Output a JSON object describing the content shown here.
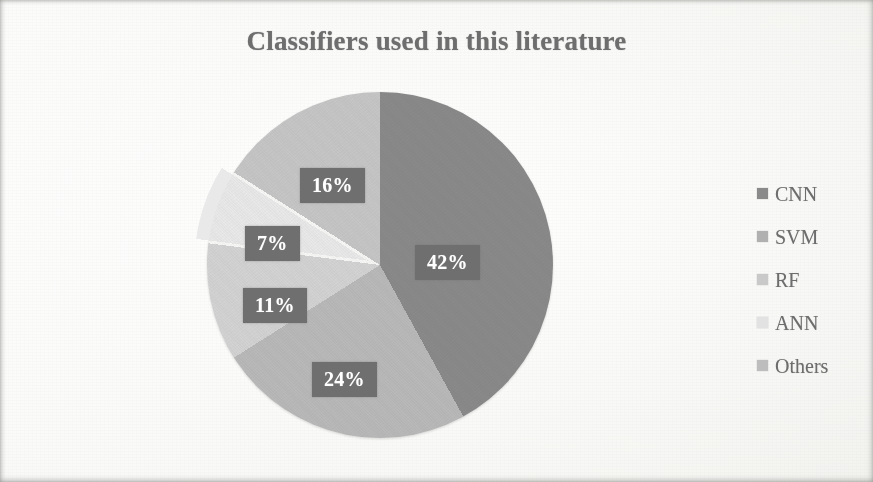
{
  "chart_data": {
    "type": "pie",
    "title": "Classifiers used in this literature",
    "xlabel": "",
    "ylabel": "",
    "categories": [
      "CNN",
      "SVM",
      "RF",
      "ANN",
      "Others"
    ],
    "values": [
      42,
      24,
      11,
      7,
      16
    ],
    "value_labels": [
      "42%",
      "24%",
      "11%",
      "7%",
      "16%"
    ],
    "units": "percent",
    "total": 100,
    "legend_position": "right",
    "grid": false,
    "start_angle_deg": 0,
    "direction": "clockwise",
    "exploded_slices": [
      "ANN"
    ],
    "slice_colors": [
      "#8a8a8a",
      "#b9b9b9",
      "#d3d3d3",
      "#e9e9e9",
      "#c6c6c6"
    ],
    "label_box_color": "#6f6f6f",
    "label_text_color": "#ffffff",
    "series": [
      {
        "name": "Classifiers",
        "points": [
          {
            "label": "CNN",
            "value": 42,
            "display": "42%",
            "color": "#8a8a8a"
          },
          {
            "label": "SVM",
            "value": 24,
            "display": "24%",
            "color": "#b9b9b9"
          },
          {
            "label": "RF",
            "value": 11,
            "display": "11%",
            "color": "#d3d3d3"
          },
          {
            "label": "ANN",
            "value": 7,
            "display": "7%",
            "color": "#e9e9e9"
          },
          {
            "label": "Others",
            "value": 16,
            "display": "16%",
            "color": "#c6c6c6"
          }
        ]
      }
    ]
  },
  "title": {
    "text": "Classifiers used in this literature",
    "color": "#6e6e6e"
  },
  "labels": [
    {
      "name": "cnn",
      "text": "42%"
    },
    {
      "name": "svm",
      "text": "24%"
    },
    {
      "name": "rf",
      "text": "11%"
    },
    {
      "name": "ann",
      "text": "7%"
    },
    {
      "name": "others",
      "text": "16%"
    }
  ],
  "legend": {
    "items": [
      {
        "label": "CNN",
        "color": "#8a8a8a"
      },
      {
        "label": "SVM",
        "color": "#b0b0b0"
      },
      {
        "label": "RF",
        "color": "#c9c9c9"
      },
      {
        "label": "ANN",
        "color": "#e2e2e2"
      },
      {
        "label": "Others",
        "color": "#bdbdbd"
      }
    ]
  }
}
